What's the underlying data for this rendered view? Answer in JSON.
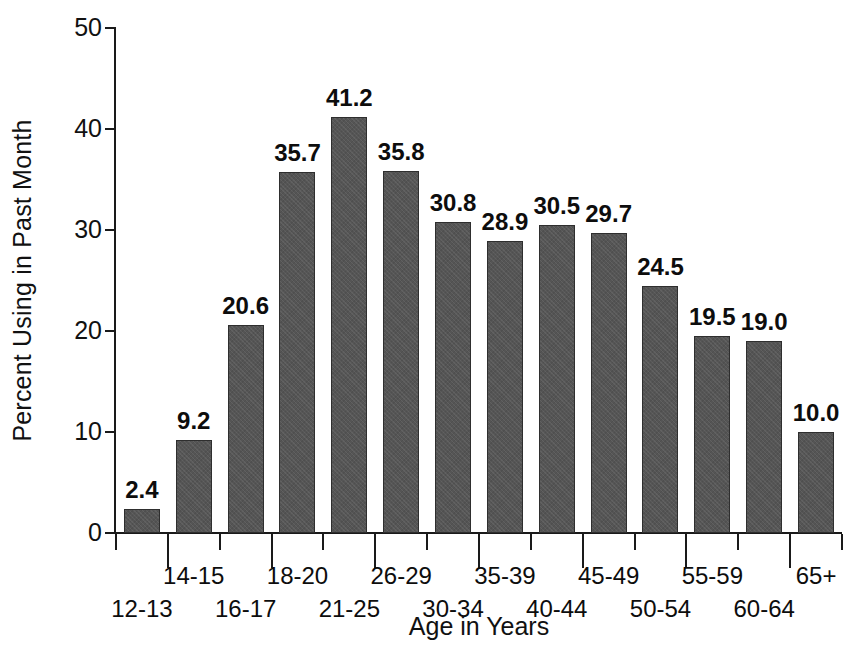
{
  "chart_data": {
    "type": "bar",
    "title": "",
    "xlabel": "Age in Years",
    "ylabel": "Percent Using in Past Month",
    "categories": [
      "12-13",
      "14-15",
      "16-17",
      "18-20",
      "21-25",
      "26-29",
      "30-34",
      "35-39",
      "40-44",
      "45-49",
      "50-54",
      "55-59",
      "60-64",
      "65+"
    ],
    "values": [
      2.4,
      9.2,
      20.6,
      35.7,
      41.2,
      35.8,
      30.8,
      28.9,
      30.5,
      29.7,
      24.5,
      19.5,
      19.0,
      10.0
    ],
    "value_labels": [
      "2.4",
      "9.2",
      "20.6",
      "35.7",
      "41.2",
      "35.8",
      "30.8",
      "28.9",
      "30.5",
      "29.7",
      "24.5",
      "19.5",
      "19.0",
      "10.0"
    ],
    "ylim": [
      0,
      50
    ],
    "yticks": [
      0,
      10,
      20,
      30,
      40,
      50
    ],
    "ytick_labels": [
      "0",
      "10",
      "20",
      "30",
      "40",
      "50"
    ],
    "grid": false,
    "legend": false,
    "bar_color": "#555555",
    "bar_outline_color": "#2e2e2e",
    "axis_color": "#1a1a1a",
    "background_color": "#ffffff",
    "label_stagger": [
      "bottom",
      "top",
      "bottom",
      "top",
      "bottom",
      "top",
      "bottom",
      "top",
      "bottom",
      "top",
      "bottom",
      "top",
      "bottom",
      "top"
    ]
  }
}
